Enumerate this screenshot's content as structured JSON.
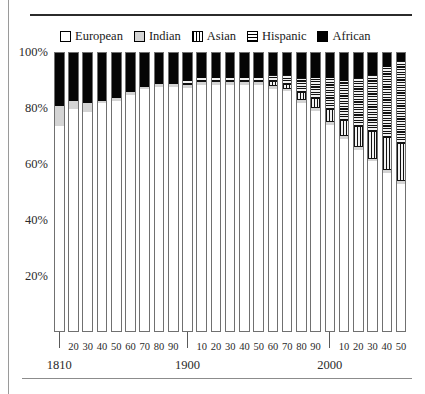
{
  "legend": {
    "position": "top",
    "items": [
      {
        "label": "European",
        "key": "european",
        "swatch": "white-square-icon",
        "color": "#ffffff"
      },
      {
        "label": "Indian",
        "key": "indian",
        "swatch": "light-gray-square-icon",
        "color": "#d4d4d4"
      },
      {
        "label": "Asian",
        "key": "asian",
        "swatch": "vertical-stripe-square-icon",
        "color": "#000000"
      },
      {
        "label": "Hispanic",
        "key": "hispanic",
        "swatch": "horizontal-stripe-square-icon",
        "color": "#000000"
      },
      {
        "label": "African",
        "key": "african",
        "swatch": "black-square-icon",
        "color": "#000000"
      }
    ]
  },
  "yaxis": {
    "ticks": [
      "100%",
      "80%",
      "60%",
      "40%",
      "20%"
    ],
    "values": [
      100,
      80,
      60,
      40,
      20
    ]
  },
  "xaxis": {
    "decade_ticks": [
      "20",
      "30",
      "40",
      "50",
      "60",
      "70",
      "80",
      "90",
      "10",
      "20",
      "30",
      "40",
      "50",
      "60",
      "70",
      "80",
      "90",
      "10",
      "20",
      "30",
      "40",
      "50"
    ],
    "era_labels": [
      "1810",
      "1900",
      "2000"
    ]
  },
  "chart_data": {
    "type": "bar",
    "subtype": "stacked-100-percent",
    "title": "",
    "subtitle": "",
    "xlabel": "",
    "ylabel": "",
    "ylim": [
      0,
      100
    ],
    "grid": false,
    "legend_position": "top",
    "categories": [
      "1810",
      "1820",
      "1830",
      "1840",
      "1850",
      "1860",
      "1870",
      "1880",
      "1890",
      "1900",
      "1910",
      "1920",
      "1930",
      "1940",
      "1950",
      "1960",
      "1970",
      "1980",
      "1990",
      "2000",
      "2010",
      "2020",
      "2030",
      "2040",
      "2050"
    ],
    "stack_order_bottom_to_top": [
      "european",
      "indian",
      "asian",
      "hispanic",
      "african"
    ],
    "series": [
      {
        "name": "European",
        "key": "european",
        "values": [
          74,
          80,
          79,
          82,
          83,
          85,
          87,
          88,
          88,
          88,
          89,
          89,
          89,
          89,
          89,
          88,
          87,
          83,
          80,
          75,
          70,
          66,
          62,
          58,
          54
        ]
      },
      {
        "name": "Indian",
        "key": "indian",
        "values": [
          7,
          3,
          3,
          1,
          1,
          1,
          1,
          1,
          1,
          1,
          1,
          1,
          1,
          1,
          1,
          1,
          1,
          1,
          1,
          1,
          1,
          1,
          1,
          1,
          1
        ]
      },
      {
        "name": "Asian",
        "key": "asian",
        "values": [
          0,
          0,
          0,
          0,
          0,
          0,
          0,
          0,
          0,
          0,
          0,
          0,
          0,
          0,
          0,
          1,
          1,
          2,
          3,
          4,
          5,
          7,
          9,
          11,
          13
        ]
      },
      {
        "name": "Hispanic",
        "key": "hispanic",
        "values": [
          0,
          0,
          0,
          0,
          0,
          0,
          0,
          0,
          0,
          1,
          1,
          1,
          1,
          1,
          1,
          2,
          3,
          5,
          7,
          11,
          14,
          17,
          20,
          25,
          29
        ]
      },
      {
        "name": "African",
        "key": "african",
        "values": [
          19,
          17,
          18,
          17,
          16,
          14,
          12,
          11,
          11,
          10,
          9,
          9,
          9,
          9,
          9,
          8,
          8,
          9,
          9,
          9,
          10,
          9,
          8,
          5,
          3
        ]
      }
    ]
  }
}
